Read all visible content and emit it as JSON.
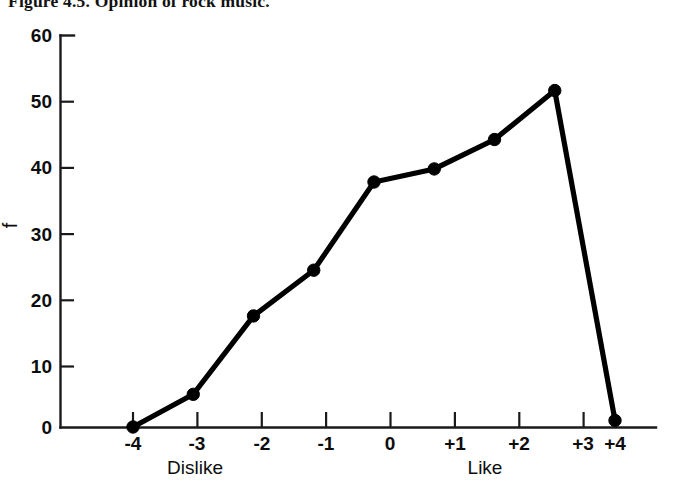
{
  "figure": {
    "title": "Figure 4.5.  Opinion of rock music.",
    "ylabel": "f",
    "anchor_low": "Dislike",
    "anchor_high": "Like"
  },
  "chart_data": {
    "type": "line",
    "title": "Figure 4.5.  Opinion of rock music.",
    "xlabel": "",
    "ylabel": "f",
    "x_categories": [
      "-4",
      "-3",
      "-2",
      "-1",
      "0",
      "+1",
      "+2",
      "+3",
      "+4"
    ],
    "x_values": [
      -4,
      -3,
      -2,
      -1,
      0,
      1,
      2,
      3,
      4
    ],
    "values": [
      0,
      5,
      17,
      24,
      37.5,
      39.5,
      44,
      51.5,
      1
    ],
    "ylim": [
      0,
      60
    ],
    "xlim": [
      -4,
      4
    ],
    "y_ticks": [
      0,
      10,
      20,
      30,
      40,
      50,
      60
    ],
    "y_ticklabels": [
      "0",
      "10",
      "20",
      "30",
      "40",
      "50",
      "60"
    ],
    "x_ticklabels": [
      "-4",
      "-3",
      "-2",
      "-1",
      "0",
      "+1",
      "+2",
      "+3",
      "+4"
    ],
    "grid": false,
    "legend": null,
    "annotations": [
      {
        "text": "Dislike",
        "near_x": "-3"
      },
      {
        "text": "Like",
        "near_x": "+2"
      }
    ],
    "marker": "filled-circle",
    "line_color": "#000000",
    "marker_color": "#000000"
  },
  "ticks": {
    "y": [
      {
        "label": "60",
        "value": 60
      },
      {
        "label": "50",
        "value": 50
      },
      {
        "label": "40",
        "value": 40
      },
      {
        "label": "30",
        "value": 30
      },
      {
        "label": "20",
        "value": 20
      },
      {
        "label": "10",
        "value": 10
      },
      {
        "label": "0",
        "value": 0
      }
    ],
    "x": [
      {
        "label": "-4",
        "value": -4
      },
      {
        "label": "-3",
        "value": -3
      },
      {
        "label": "-2",
        "value": -2
      },
      {
        "label": "-1",
        "value": -1
      },
      {
        "label": "0",
        "value": 0
      },
      {
        "label": "+1",
        "value": 1
      },
      {
        "label": "+2",
        "value": 2
      },
      {
        "label": "+3",
        "value": 3
      },
      {
        "label": "+4",
        "value": 4
      }
    ]
  }
}
